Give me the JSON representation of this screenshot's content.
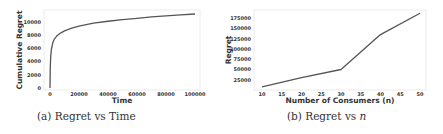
{
  "captions": {
    "a": {
      "prefix": "(a) Regret vs Time"
    },
    "b": {
      "prefix": "(b) Regret vs ",
      "var": "n"
    }
  },
  "chart_data": [
    {
      "type": "line",
      "title": "",
      "caption": "(a) Regret vs Time",
      "xlabel": "Time",
      "ylabel": "Cumulative Regret",
      "xlim": [
        0,
        100000
      ],
      "ylim": [
        0,
        11500
      ],
      "xticks": [
        0,
        20000,
        40000,
        60000,
        80000,
        100000
      ],
      "yticks": [
        0,
        2000,
        4000,
        6000,
        8000,
        10000
      ],
      "grid": false,
      "line_color": "#555555",
      "x": [
        0,
        200,
        500,
        1000,
        2000,
        3000,
        5000,
        7500,
        10000,
        15000,
        20000,
        30000,
        40000,
        50000,
        60000,
        70000,
        80000,
        90000,
        100000
      ],
      "series": [
        {
          "name": "Cumulative Regret",
          "values": [
            0,
            3200,
            4800,
            5900,
            6900,
            7400,
            7950,
            8350,
            8650,
            9050,
            9350,
            9800,
            10100,
            10350,
            10550,
            10750,
            10900,
            11050,
            11200
          ]
        }
      ]
    },
    {
      "type": "line",
      "title": "",
      "caption": "(b) Regret vs n",
      "xlabel": "Number of Consumers (n)",
      "ylabel": "Regret",
      "xlim": [
        10,
        50
      ],
      "ylim": [
        5000,
        190000
      ],
      "xticks": [
        10,
        15,
        20,
        25,
        30,
        35,
        40,
        45,
        50
      ],
      "yticks": [
        25000,
        50000,
        75000,
        100000,
        125000,
        150000,
        175000
      ],
      "grid": false,
      "line_color": "#555555",
      "x": [
        10,
        20,
        30,
        40,
        50
      ],
      "series": [
        {
          "name": "Regret",
          "values": [
            8000,
            30000,
            50000,
            135000,
            187000
          ]
        }
      ]
    }
  ]
}
